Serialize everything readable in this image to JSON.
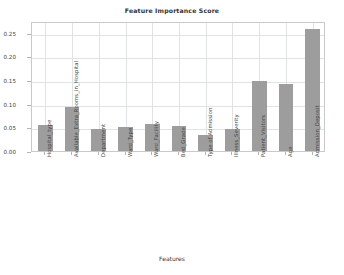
{
  "chart_data": {
    "type": "bar",
    "title": "Feature Importance Score",
    "xlabel": "Features",
    "ylabel": "",
    "grid": true,
    "legend": "none",
    "ylim": [
      0.0,
      0.275
    ],
    "yticks": [
      "0.00",
      "0.05",
      "0.10",
      "0.15",
      "0.20",
      "0.25"
    ],
    "ytick_values": [
      0.0,
      0.05,
      0.1,
      0.15,
      0.2,
      0.25
    ],
    "categories": [
      "Hospital_type",
      "Available_Extra_Rooms_in_Hospital",
      "Department",
      "Ward_Type",
      "Ward_Facility",
      "Bed_Grade",
      "Type of Admission",
      "Illness_Severity",
      "Patient_Visitors",
      "Age",
      "Admission_Deposit"
    ],
    "values": [
      0.055,
      0.094,
      0.046,
      0.05,
      0.057,
      0.053,
      0.034,
      0.047,
      0.148,
      0.141,
      0.258
    ],
    "bar_color": "#9d9d9d",
    "grid_color": "#dfe3e6",
    "axis_color": "#c9c9c9"
  }
}
